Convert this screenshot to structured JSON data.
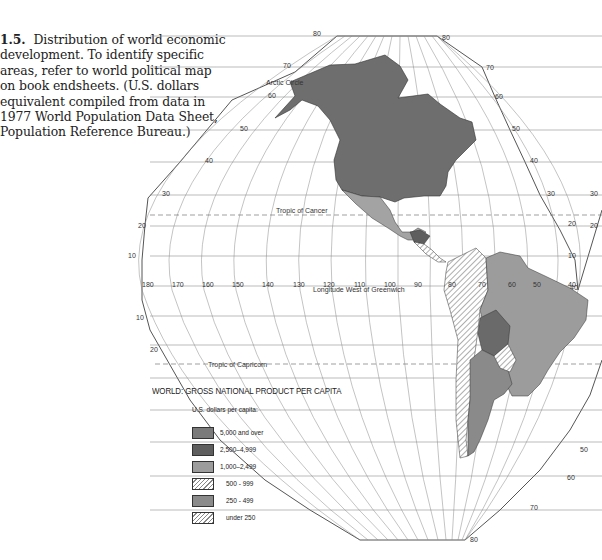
{
  "caption": {
    "number": "1.5.",
    "text": "Distribution of world economic development. To identify specific areas, refer to world political map on book endsheets. (U.S. dollars equivalent compiled from data in 1977 World Population Data Sheet, Population Reference Bureau.)"
  },
  "map": {
    "title": "WORLD: GROSS NATIONAL PRODUCT PER CAPITA",
    "subtitle": "U.S. dollars per capita:",
    "labels": {
      "arctic_circle": "Arctic Circle",
      "tropic_cancer": "Tropic of Cancer",
      "tropic_capricorn": "Tropic of Capricorn",
      "longitude": "Longitude West of Greenwich"
    },
    "longitude_ticks": [
      "180",
      "170",
      "160",
      "150",
      "140",
      "130",
      "120",
      "110",
      "100",
      "90",
      "80",
      "70",
      "60",
      "50",
      "40"
    ],
    "latitude_ticks_left": [
      "80",
      "70",
      "60",
      "50",
      "40",
      "30",
      "20",
      "10",
      "10",
      "20"
    ],
    "latitude_ticks_right": [
      "80",
      "70",
      "60",
      "50",
      "40",
      "30",
      "20",
      "10",
      "40",
      "30",
      "20",
      "50",
      "60",
      "70",
      "80"
    ],
    "legend": [
      {
        "label": "5,000 and over",
        "fill": "#7a7a7a",
        "pattern": "solid"
      },
      {
        "label": "2,500–4,999",
        "fill": "#5e5e5e",
        "pattern": "solid"
      },
      {
        "label": "1,000–2,499",
        "fill": "#9c9c9c",
        "pattern": "solid"
      },
      {
        "label": "500 - 999",
        "fill": "#ffffff",
        "pattern": "hatch"
      },
      {
        "label": "250 - 499",
        "fill": "#8a8a8a",
        "pattern": "solid"
      },
      {
        "label": "under 250",
        "fill": "#ffffff",
        "pattern": "hatch"
      }
    ]
  }
}
